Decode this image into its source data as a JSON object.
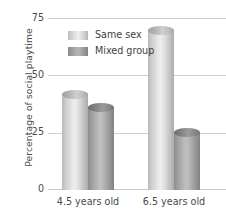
{
  "chart_data": {
    "type": "bar",
    "title": "",
    "xlabel": "",
    "ylabel": "Percentage of social playtime",
    "categories": [
      "4.5 years old",
      "6.5 years old"
    ],
    "series": [
      {
        "name": "Same sex",
        "values": [
          44,
          72
        ],
        "color": "#dcdcdc"
      },
      {
        "name": "Mixed group",
        "values": [
          38,
          27
        ],
        "color": "#9c9c9c"
      }
    ],
    "ylim": [
      0,
      75
    ],
    "yticks": [
      0,
      25,
      50,
      75
    ],
    "ytick_labels": [
      "0",
      "25",
      "50",
      "75"
    ],
    "grid": true,
    "legend_position": "top-left-inside",
    "bar_style": "cylinder"
  },
  "axis": {
    "y_title": "Percentage of social playtime",
    "y_labels": {
      "t75": "75",
      "t50": "50",
      "t25": "25",
      "t0": "0"
    },
    "x_labels": {
      "g0": "4.5 years old",
      "g1": "6.5 years old"
    }
  },
  "legend": {
    "items": [
      {
        "label": "Same sex"
      },
      {
        "label": "Mixed group"
      }
    ]
  }
}
